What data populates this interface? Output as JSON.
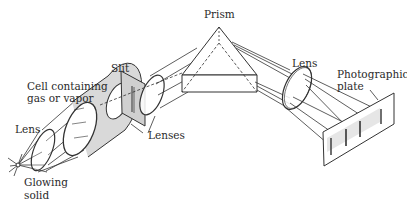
{
  "diagram": {
    "labels": {
      "prism": "Prism",
      "slit": "Slit",
      "cell_line1": "Cell containing",
      "cell_line2": "gas or vapor",
      "lens_left": "Lens",
      "lenses": "Lenses",
      "glowing_line1": "Glowing",
      "glowing_line2": "solid",
      "lens_right": "Lens",
      "plate_line1": "Photographic",
      "plate_line2": "plate"
    },
    "colors": {
      "stroke": "#333333",
      "fill_gray": "#d9d9d9",
      "background": "#ffffff"
    }
  }
}
